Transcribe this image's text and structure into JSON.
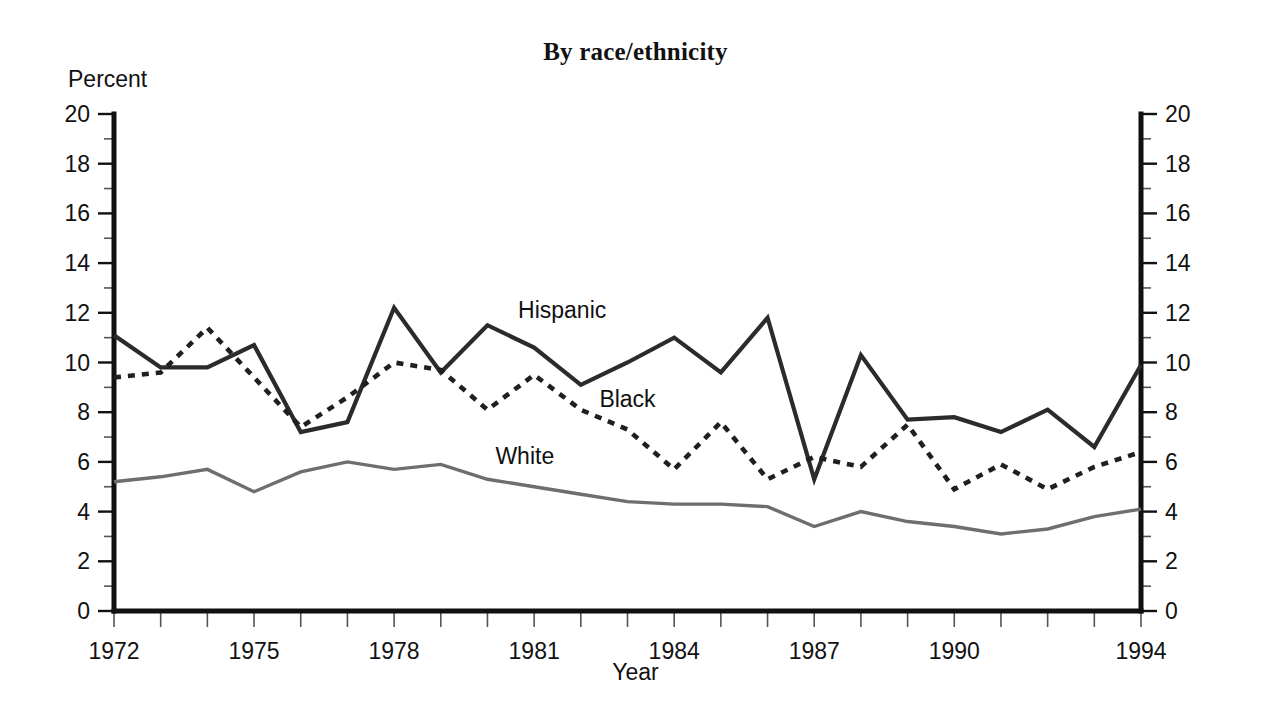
{
  "chart_data": {
    "type": "line",
    "title": "By race/ethnicity",
    "subtitle": "",
    "xlabel": "Year",
    "ylabel": "Percent",
    "ylim": [
      0,
      20
    ],
    "xlim": [
      1972,
      1994
    ],
    "grid": false,
    "legend_position": "inline-annotations",
    "y_ticks": [
      0,
      2,
      4,
      6,
      8,
      10,
      12,
      14,
      16,
      18,
      20
    ],
    "y_tick_labels": [
      "0",
      "2",
      "4",
      "6",
      "8",
      "10",
      "12",
      "14",
      "16",
      "18",
      "20"
    ],
    "y_minor_ticks": [
      1,
      3,
      5,
      7,
      9,
      11,
      13,
      15,
      17,
      19
    ],
    "dual_y_axis": true,
    "x": [
      1972,
      1973,
      1974,
      1975,
      1976,
      1977,
      1978,
      1979,
      1980,
      1981,
      1982,
      1983,
      1984,
      1985,
      1986,
      1987,
      1988,
      1989,
      1990,
      1991,
      1992,
      1993,
      1994
    ],
    "x_tick_labels": [
      "1972",
      "1975",
      "1978",
      "1981",
      "1984",
      "1987",
      "1990",
      "1994"
    ],
    "x_tick_values": [
      1972,
      1975,
      1978,
      1981,
      1984,
      1987,
      1990,
      1994
    ],
    "series": [
      {
        "name": "Hispanic",
        "style": "solid",
        "color": "#2b2b2b",
        "values": [
          11.1,
          9.8,
          9.8,
          10.7,
          7.2,
          7.6,
          12.2,
          9.6,
          11.5,
          10.6,
          9.1,
          10.0,
          11.0,
          9.6,
          11.8,
          5.3,
          10.3,
          7.7,
          7.8,
          7.2,
          8.1,
          6.6,
          9.9
        ]
      },
      {
        "name": "Black",
        "style": "dashed",
        "color": "#1f1f1f",
        "values": [
          9.4,
          9.6,
          11.4,
          9.4,
          7.4,
          8.6,
          10.0,
          9.7,
          8.1,
          9.5,
          8.1,
          7.3,
          5.7,
          7.6,
          5.3,
          6.2,
          5.8,
          7.5,
          4.9,
          5.9,
          4.9,
          5.8,
          6.4
        ]
      },
      {
        "name": "White",
        "style": "solid-gray",
        "color": "#6e6e6e",
        "values": [
          5.2,
          5.4,
          5.7,
          4.8,
          5.6,
          6.0,
          5.7,
          5.9,
          5.3,
          5.0,
          4.7,
          4.4,
          4.3,
          4.3,
          4.2,
          3.4,
          4.0,
          3.6,
          3.4,
          3.1,
          3.3,
          3.8,
          4.1
        ]
      }
    ],
    "annotations": [
      {
        "text": "Hispanic",
        "x": 1981.6,
        "y": 11.8
      },
      {
        "text": "Black",
        "x": 1983.0,
        "y": 8.2
      },
      {
        "text": "White",
        "x": 1980.8,
        "y": 5.9
      }
    ]
  },
  "axes": {
    "percent_label": "Percent",
    "year_label": "Year"
  }
}
